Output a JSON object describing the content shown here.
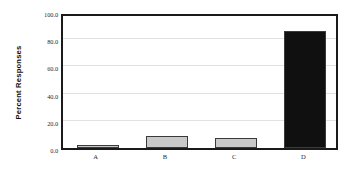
{
  "chart_data": {
    "type": "bar",
    "title": "",
    "xlabel": "",
    "ylabel": "Percent Responses",
    "categories": [
      "A",
      "B",
      "C",
      "D"
    ],
    "values": [
      2.5,
      9.0,
      7.0,
      86.0
    ],
    "ylim": [
      0.0,
      100.0
    ],
    "yticks": [
      "0.0",
      "20.0",
      "40.0",
      "60.0",
      "80.0",
      "100.0"
    ],
    "ytick_values": [
      0.0,
      20.0,
      40.0,
      60.0,
      80.0,
      100.0
    ],
    "grid": true,
    "legend": "none",
    "bar_colors": [
      "#c9c9c9",
      "#c9c9c9",
      "#c9c9c9",
      "#101010"
    ],
    "bar_edge_color": "#3a3a3a",
    "frame_color": "#1a1a1a",
    "gridline_color": "#e2e2e2",
    "background": "#ffffff"
  }
}
